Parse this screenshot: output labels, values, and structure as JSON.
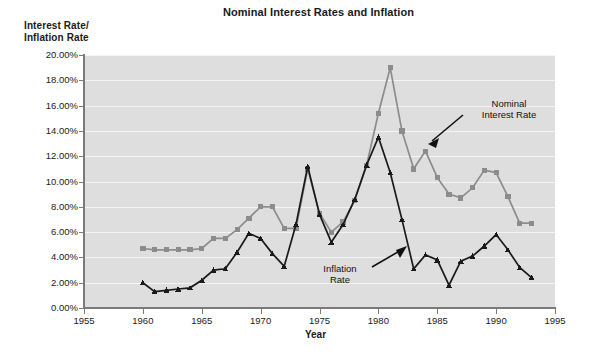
{
  "chart_data": {
    "type": "line",
    "title": "Nominal Interest Rates and Inflation",
    "xlabel": "Year",
    "ylabel": "Interest Rate/\nInflation Rate",
    "xlim": [
      1955,
      1995
    ],
    "ylim": [
      0,
      20
    ],
    "xticks": [
      1955,
      1960,
      1965,
      1970,
      1975,
      1980,
      1985,
      1990,
      1995
    ],
    "xtick_labels": [
      "1955",
      "1960",
      "1965",
      "1970",
      "1975",
      "1980",
      "1985",
      "1990",
      "1995"
    ],
    "yticks": [
      0,
      2,
      4,
      6,
      8,
      10,
      12,
      14,
      16,
      18,
      20
    ],
    "ytick_labels": [
      "0.00%",
      "2.00%",
      "4.00%",
      "6.00%",
      "8.00%",
      "10.00%",
      "12.00%",
      "14.00%",
      "16.00%",
      "18.00%",
      "20.00%"
    ],
    "grid": true,
    "grid_axis": "y",
    "plot_background": "#dedede",
    "gridline_color": "#f4f4f4",
    "legend": "none",
    "annotations": [
      {
        "name": "nominal-interest-rate",
        "text": "Nominal\nInterest Rate",
        "points_to_year": 1984,
        "points_to_value": 12.4
      },
      {
        "name": "inflation-rate",
        "text": "Inflation\nRate",
        "points_to_year": 1979,
        "points_to_value": 11.3
      }
    ],
    "x": [
      1960,
      1961,
      1962,
      1963,
      1964,
      1965,
      1966,
      1967,
      1968,
      1969,
      1970,
      1971,
      1972,
      1973,
      1974,
      1975,
      1976,
      1977,
      1978,
      1979,
      1980,
      1981,
      1982,
      1983,
      1984,
      1985,
      1986,
      1987,
      1988,
      1989,
      1990,
      1991,
      1992,
      1993
    ],
    "series": [
      {
        "name": "Nominal Interest Rate",
        "color": "#8c8c8c",
        "marker": "square",
        "values": [
          4.7,
          4.6,
          4.6,
          4.6,
          4.6,
          4.7,
          5.5,
          5.5,
          6.2,
          7.1,
          8.0,
          8.0,
          6.3,
          6.3,
          11.0,
          7.5,
          6.0,
          6.8,
          8.5,
          11.3,
          15.4,
          19.0,
          14.0,
          11.0,
          12.4,
          10.3,
          9.0,
          8.7,
          9.5,
          10.9,
          10.7,
          8.8,
          6.7,
          6.7
        ]
      },
      {
        "name": "Inflation Rate",
        "color": "#1a1a1a",
        "marker": "triangle",
        "values": [
          2.0,
          1.3,
          1.4,
          1.5,
          1.6,
          2.2,
          3.0,
          3.1,
          4.4,
          5.9,
          5.5,
          4.3,
          3.3,
          6.6,
          11.2,
          7.4,
          5.2,
          6.6,
          8.6,
          11.3,
          13.5,
          10.7,
          7.0,
          3.1,
          4.2,
          3.8,
          1.8,
          3.7,
          4.1,
          4.9,
          5.8,
          4.6,
          3.2,
          2.4
        ]
      }
    ]
  }
}
